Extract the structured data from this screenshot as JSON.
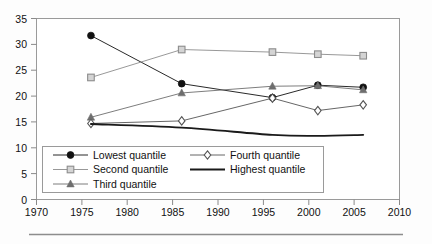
{
  "chart_data": {
    "type": "line",
    "title": "",
    "subtitle": "",
    "xlabel": "",
    "ylabel": "",
    "xlim": [
      1970,
      2010
    ],
    "ylim": [
      0,
      35
    ],
    "xticks": [
      1970,
      1975,
      1980,
      1985,
      1990,
      1995,
      2000,
      2005,
      2010
    ],
    "yticks": [
      0,
      5,
      10,
      15,
      20,
      25,
      30,
      35
    ],
    "xtick_labels": [
      "1970",
      "1975",
      "1980",
      "1985",
      "1990",
      "1995",
      "2000",
      "2005",
      "2010"
    ],
    "ytick_labels": [
      "0",
      "5",
      "10",
      "15",
      "20",
      "25",
      "30",
      "35"
    ],
    "grid": false,
    "legend_position": "inside-bottom-left",
    "x": [
      1976,
      1986,
      1996,
      2001,
      2006
    ],
    "series": [
      {
        "name": "Lowest quantile",
        "marker": "filled-circle",
        "color": "#111111",
        "values": [
          31.7,
          22.4,
          19.7,
          22.1,
          21.7
        ]
      },
      {
        "name": "Second quantile",
        "marker": "open-square",
        "color": "#8c8c8c",
        "values": [
          23.6,
          29.0,
          28.5,
          28.1,
          27.8
        ]
      },
      {
        "name": "Third quantile",
        "marker": "filled-triangle",
        "color": "#6e6e6e",
        "values": [
          15.9,
          20.6,
          21.9,
          22.0,
          21.2
        ]
      },
      {
        "name": "Fourth quantile",
        "marker": "open-diamond",
        "color": "#555555",
        "values": [
          14.7,
          15.2,
          19.6,
          17.2,
          18.3
        ]
      },
      {
        "name": "Highest quantile",
        "marker": "none",
        "color": "#1a1a1a",
        "values": [
          14.6,
          13.9,
          12.5,
          12.3,
          12.5
        ]
      }
    ],
    "legend_entries": [
      {
        "label": "Lowest quantile",
        "marker": "filled-circle",
        "color": "#111111"
      },
      {
        "label": "Second quantile",
        "marker": "open-square",
        "color": "#8c8c8c"
      },
      {
        "label": "Third quantile",
        "marker": "filled-triangle",
        "color": "#6e6e6e"
      },
      {
        "label": "Fourth quantile",
        "marker": "open-diamond",
        "color": "#555555"
      },
      {
        "label": "Highest quantile",
        "marker": "none",
        "color": "#1a1a1a"
      }
    ]
  },
  "axes": {
    "y_labels": [
      "35",
      "30",
      "25",
      "20",
      "15",
      "10",
      "5",
      "0"
    ],
    "x_labels": [
      "1970",
      "1975",
      "1980",
      "1985",
      "1990",
      "1995",
      "2000",
      "2005",
      "2010"
    ]
  },
  "legend": {
    "items": [
      {
        "label": "Lowest quantile"
      },
      {
        "label": "Second quantile"
      },
      {
        "label": "Third quantile"
      },
      {
        "label": "Fourth quantile"
      },
      {
        "label": "Highest quantile"
      }
    ]
  },
  "colors": {
    "lowest": "#111111",
    "second": "#8c8c8c",
    "third": "#6e6e6e",
    "fourth": "#555555",
    "highest": "#1a1a1a",
    "axis": "#808080",
    "background": "#fdfdfd",
    "rule": "#8d8d8d"
  }
}
